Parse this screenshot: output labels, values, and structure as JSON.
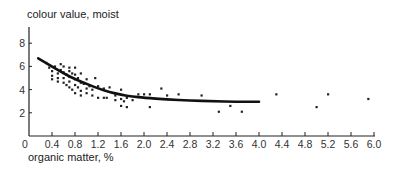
{
  "chart_data": {
    "type": "scatter",
    "title": "",
    "ylabel": "colour value, moist",
    "xlabel": "organic matter, %",
    "xlim": [
      0,
      6.0
    ],
    "ylim": [
      0,
      9.2
    ],
    "x_ticks": [
      "0",
      "0.4",
      "0.8",
      "1.2",
      "1.6",
      "2.0",
      "2.4",
      "2.8",
      "3.2",
      "3.6",
      "4.0",
      "4.4",
      "4.8",
      "5.2",
      "5.6",
      "6.0"
    ],
    "y_ticks": [
      "2",
      "4",
      "6",
      "8"
    ],
    "grid": false,
    "legend": null,
    "series": [
      {
        "name": "observations",
        "kind": "points",
        "points": [
          [
            0.3,
            6.3
          ],
          [
            0.35,
            5.9
          ],
          [
            0.4,
            5.6
          ],
          [
            0.4,
            5.2
          ],
          [
            0.4,
            4.9
          ],
          [
            0.45,
            6.0
          ],
          [
            0.5,
            5.4
          ],
          [
            0.5,
            5.0
          ],
          [
            0.5,
            4.7
          ],
          [
            0.55,
            6.2
          ],
          [
            0.55,
            5.7
          ],
          [
            0.6,
            6.0
          ],
          [
            0.6,
            5.5
          ],
          [
            0.6,
            5.0
          ],
          [
            0.6,
            4.6
          ],
          [
            0.65,
            5.3
          ],
          [
            0.65,
            4.4
          ],
          [
            0.7,
            5.9
          ],
          [
            0.7,
            5.6
          ],
          [
            0.7,
            5.1
          ],
          [
            0.7,
            4.7
          ],
          [
            0.7,
            4.2
          ],
          [
            0.75,
            5.4
          ],
          [
            0.75,
            4.0
          ],
          [
            0.8,
            5.9
          ],
          [
            0.8,
            5.3
          ],
          [
            0.8,
            4.9
          ],
          [
            0.8,
            4.4
          ],
          [
            0.8,
            3.7
          ],
          [
            0.85,
            5.0
          ],
          [
            0.85,
            4.2
          ],
          [
            0.9,
            5.4
          ],
          [
            0.9,
            4.6
          ],
          [
            0.9,
            3.9
          ],
          [
            0.9,
            3.5
          ],
          [
            0.95,
            4.5
          ],
          [
            1.0,
            4.9
          ],
          [
            1.0,
            4.1
          ],
          [
            1.0,
            3.7
          ],
          [
            1.05,
            4.3
          ],
          [
            1.1,
            4.0
          ],
          [
            1.1,
            3.5
          ],
          [
            1.15,
            5.0
          ],
          [
            1.2,
            4.3
          ],
          [
            1.2,
            3.3
          ],
          [
            1.3,
            4.1
          ],
          [
            1.3,
            3.3
          ],
          [
            1.35,
            3.3
          ],
          [
            1.4,
            4.2
          ],
          [
            1.5,
            3.5
          ],
          [
            1.5,
            3.1
          ],
          [
            1.6,
            4.0
          ],
          [
            1.6,
            3.2
          ],
          [
            1.6,
            2.6
          ],
          [
            1.65,
            3.0
          ],
          [
            1.7,
            3.3
          ],
          [
            1.7,
            2.5
          ],
          [
            1.8,
            3.1
          ],
          [
            1.9,
            3.6
          ],
          [
            2.0,
            3.6
          ],
          [
            2.1,
            3.6
          ],
          [
            2.1,
            2.5
          ],
          [
            2.3,
            4.1
          ],
          [
            2.4,
            3.5
          ],
          [
            2.6,
            3.6
          ],
          [
            3.0,
            3.5
          ],
          [
            3.3,
            2.1
          ],
          [
            3.5,
            2.6
          ],
          [
            3.7,
            2.1
          ],
          [
            4.3,
            3.6
          ],
          [
            5.0,
            2.5
          ],
          [
            5.2,
            3.6
          ],
          [
            5.9,
            3.2
          ]
        ]
      },
      {
        "name": "fitted curve",
        "kind": "line",
        "points": [
          [
            0.16,
            6.7
          ],
          [
            0.4,
            6.0
          ],
          [
            0.6,
            5.4
          ],
          [
            0.8,
            4.9
          ],
          [
            1.0,
            4.5
          ],
          [
            1.2,
            4.1
          ],
          [
            1.4,
            3.8
          ],
          [
            1.6,
            3.55
          ],
          [
            1.8,
            3.4
          ],
          [
            2.0,
            3.3
          ],
          [
            2.4,
            3.15
          ],
          [
            2.8,
            3.05
          ],
          [
            3.2,
            3.0
          ],
          [
            3.6,
            2.95
          ],
          [
            4.0,
            2.95
          ]
        ]
      }
    ]
  },
  "labels": {
    "y_axis_title": "colour value, moist",
    "x_axis_title": "organic matter, %"
  }
}
